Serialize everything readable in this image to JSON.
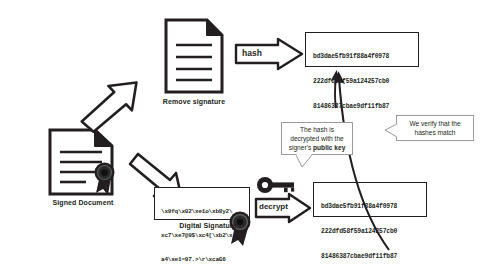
{
  "diagram": {
    "colors": {
      "ink": "#231f20",
      "callout_border": "#9a9a9a",
      "background": "#ffffff"
    },
    "nodes": {
      "signed_document": {
        "label": "Signed Document",
        "icon": "document-with-seal-icon"
      },
      "removed_signature_document": {
        "label": "Remove signature",
        "icon": "document-icon"
      },
      "digital_signature": {
        "label": "Digital Signature",
        "icon": "seal-icon",
        "line1": "\\x9fq\\x02\\xe1o\\xb8y2\\",
        "line2": "xc7\\xe7@9$\\xc4[\\xb2\\x",
        "line3": "a4\\xe1=97.>\\r\\xcaG6"
      },
      "hash_top": {
        "line1": "bd3dae5fb91f88a4f0978",
        "line2": "222dfd58f59a124257cb0",
        "line3": "81486387cbae9df11fb87"
      },
      "hash_bottom": {
        "line1": "bd3dae5fb91f88a4f0978",
        "line2": "222dfd58f59a124257cb0",
        "line3": "81486387cbae9df11fb87"
      }
    },
    "arrows": {
      "hash": {
        "label": "hash"
      },
      "decrypt": {
        "label": "decrypt"
      },
      "split_top": {
        "label": ""
      },
      "split_bottom": {
        "label": ""
      },
      "compare_top": {
        "label": ""
      },
      "compare_bottom": {
        "label": ""
      }
    },
    "key_icon": {
      "name": "key-icon"
    },
    "callouts": {
      "decrypt_note": {
        "line1": "The hash is",
        "line2": "decrypted with the",
        "line3_prefix": "signer's ",
        "line3_bold": "public key"
      },
      "verify_note": {
        "line1": "We verify that the",
        "line2": "hashes match"
      }
    }
  }
}
